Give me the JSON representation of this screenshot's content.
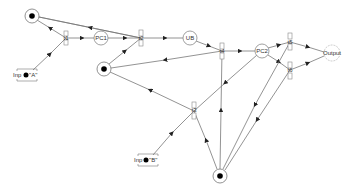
{
  "diagram": {
    "type": "petri-net",
    "colors": {
      "line": "#555555",
      "token": "#000000",
      "node_stroke": "#888888",
      "background": "#ffffff"
    },
    "places": [
      {
        "id": "p_top",
        "label": "",
        "x": 32,
        "y": 16,
        "tokens": 1
      },
      {
        "id": "pc1",
        "label": "PC1",
        "x": 101,
        "y": 38,
        "tokens": 0
      },
      {
        "id": "p_mid",
        "label": "",
        "x": 104,
        "y": 69,
        "tokens": 1
      },
      {
        "id": "ub",
        "label": "UB",
        "x": 190,
        "y": 38,
        "tokens": 0
      },
      {
        "id": "pc2",
        "label": "PC2",
        "x": 262,
        "y": 51,
        "tokens": 0
      },
      {
        "id": "output",
        "label": "Output",
        "x": 332,
        "y": 53,
        "tokens": 0
      },
      {
        "id": "p_bottom",
        "label": "",
        "x": 220,
        "y": 176,
        "tokens": 1
      }
    ],
    "inputs": [
      {
        "id": "inp_a",
        "label": "Inp",
        "suffix": "\"A\"",
        "x": 27,
        "y": 75
      },
      {
        "id": "inp_b",
        "label": "Inp",
        "suffix": "\"B\"",
        "x": 147,
        "y": 160
      }
    ],
    "transitions": [
      {
        "id": "t1",
        "label": "t1",
        "x": 66,
        "y": 38
      },
      {
        "id": "t2",
        "label": "t2",
        "x": 141,
        "y": 38
      },
      {
        "id": "t3",
        "label": "t3",
        "x": 194,
        "y": 111
      },
      {
        "id": "t4",
        "label": "t4",
        "x": 222,
        "y": 51
      },
      {
        "id": "t5",
        "label": "t5",
        "x": 290,
        "y": 42
      },
      {
        "id": "t6",
        "label": "t6",
        "x": 290,
        "y": 70
      }
    ]
  }
}
